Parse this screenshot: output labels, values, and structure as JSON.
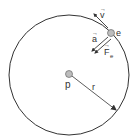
{
  "diagram": {
    "labels": {
      "velocity": "v",
      "electron": "e",
      "acceleration": "a",
      "force": "F",
      "force_subscript": "e",
      "proton": "p",
      "radius": "r"
    },
    "colors": {
      "stroke": "#333333",
      "particle_fill": "#bdbdbd",
      "background": "#ffffff"
    }
  }
}
